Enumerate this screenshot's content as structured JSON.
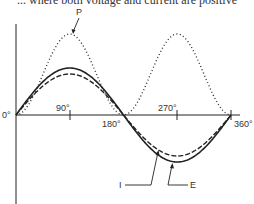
{
  "caption": "... where both voltage and current are positive",
  "axes": {
    "origin_label": "0°",
    "ticks": [
      "90°",
      "180°",
      "270°",
      "360°"
    ]
  },
  "labels": {
    "power": "P",
    "current": "I",
    "voltage": "E"
  },
  "colors": {
    "line": "#222222",
    "text": "#333333"
  }
}
